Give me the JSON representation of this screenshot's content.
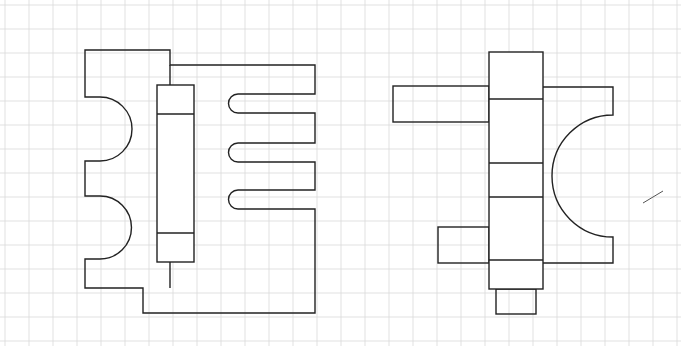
{
  "sheet": {
    "background": "#ffffff",
    "grid_color": "#d9d9d9",
    "line_color": "#222222",
    "grid_spacing_px": 24,
    "grid_offset": {
      "x": 5,
      "y": 5
    }
  },
  "figures": [
    {
      "id": "left-figure",
      "description": "Plate with two semicircular cutouts, a vertical column with two bands, and three rounded slot prongs",
      "outline_path": "M85,50 L170,50 L170,65 L315,65 L315,94 L238,94 A9.5,9.5 0 0 0 238,113 L315,113 L315,143 L238,143 A9.5,9.5 0 0 0 238,162 L315,162 L315,190 L238,190 A9.5,9.5 0 0 0 238,209 L315,209 L315,313 L143,313 L143,288 L85,288 L85,259 L100,259 A31.5,31.5 0 0 0 100,196 L85,196 L85,161 L100,161 A32,32 0 0 0 100,97 L85,97 Z",
      "column": {
        "x": 157,
        "y": 85,
        "w": 37,
        "h": 177,
        "bands_y": [
          114,
          233
        ]
      },
      "inner_lines": [
        "M170,65 L170,85",
        "M170,262 L170,288"
      ]
    },
    {
      "id": "right-figure",
      "description": "Vertical column with side arms, a concave quarter-arc flange and a bottom stub",
      "column": {
        "x": 489,
        "y": 52,
        "w": 54,
        "h": 237,
        "bands_y": [
          99,
          163,
          197,
          260
        ]
      },
      "left_arm": {
        "x": 393,
        "y": 86,
        "w": 96,
        "h": 36
      },
      "lower_left_arm": {
        "x": 438,
        "y": 227,
        "w": 51,
        "h": 36
      },
      "bottom_stub": {
        "x": 496,
        "y": 289,
        "w": 40,
        "h": 25
      },
      "flange_path": "M543,87 L613,87 L613,115 A58,58 0 0 0 613,237 L613,263 L543,263"
    }
  ],
  "stray_mark": {
    "x1": 643,
    "y1": 203,
    "x2": 663,
    "y2": 191
  }
}
